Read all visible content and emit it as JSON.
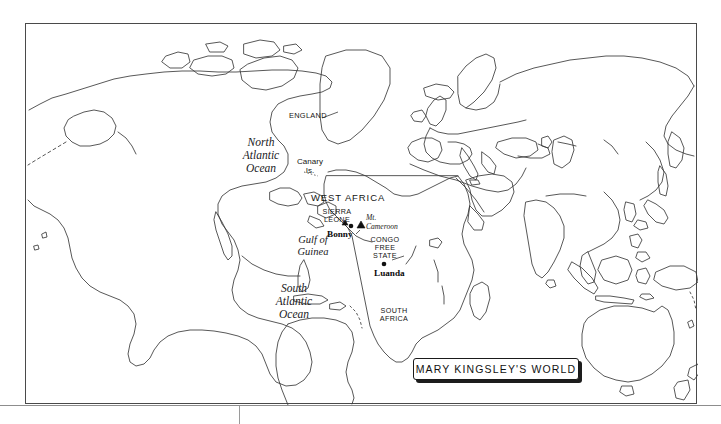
{
  "map": {
    "title": "MARY KINGSLEY'S WORLD",
    "frame": {
      "stroke": "#4a4a4a",
      "fill": "#ffffff"
    },
    "coastline_color": "#3a3a3a",
    "labels": {
      "north_atlantic": "North\nAtlantic\nOcean",
      "north_atlantic_lines": [
        "North",
        "Atlantic",
        "Ocean"
      ],
      "south_atlantic_lines": [
        "South",
        "Atlantic",
        "Ocean"
      ],
      "england": "ENGLAND",
      "canary_lines": [
        "Canary",
        "Is."
      ],
      "west_africa": "WEST AFRICA",
      "sierra_leone_lines": [
        "SIERRA",
        "LEONE"
      ],
      "bonny": "Bonny",
      "mt_cameroon_lines": [
        "Mt.",
        "Cameroon"
      ],
      "congo_free_state_lines": [
        "CONGO",
        "FREE",
        "STATE"
      ],
      "luanda": "Luanda",
      "gulf_of_guinea_lines": [
        "Gulf of",
        "Guinea"
      ],
      "south_africa_lines": [
        "SOUTH",
        "AFRICA"
      ]
    },
    "markers": [
      {
        "name": "bonny",
        "type": "city-dot",
        "label": "Bonny"
      },
      {
        "name": "mt-cameroon",
        "type": "mountain-triangle",
        "label": "Mt. Cameroon"
      },
      {
        "name": "luanda",
        "type": "city-dot",
        "label": "Luanda"
      }
    ]
  }
}
